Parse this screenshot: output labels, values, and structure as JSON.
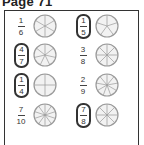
{
  "page": {
    "title": "Page 71"
  },
  "items": [
    {
      "numerator": "1",
      "denominator": "6",
      "slices": 6,
      "circled": false
    },
    {
      "numerator": "1",
      "denominator": "5",
      "slices": 5,
      "circled": true
    },
    {
      "numerator": "4",
      "denominator": "7",
      "slices": 7,
      "circled": true
    },
    {
      "numerator": "3",
      "denominator": "8",
      "slices": 8,
      "circled": false
    },
    {
      "numerator": "1",
      "denominator": "4",
      "slices": 4,
      "circled": true
    },
    {
      "numerator": "2",
      "denominator": "9",
      "slices": 9,
      "circled": false
    },
    {
      "numerator": "7",
      "denominator": "10",
      "slices": 10,
      "circled": false
    },
    {
      "numerator": "7",
      "denominator": "8",
      "slices": 8,
      "circled": true
    }
  ],
  "colors": {
    "ink": "#333333",
    "pie_fill": "#f2f2f2",
    "pie_stroke": "#9a9a9a"
  }
}
